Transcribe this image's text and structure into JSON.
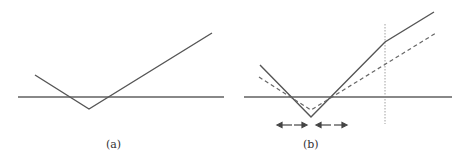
{
  "panels": [
    {
      "id": "a",
      "caption": "(a)"
    },
    {
      "id": "b",
      "caption": "(b)"
    }
  ],
  "colors": {
    "line": "#555555",
    "dashed": "#666666",
    "axis": "#606060"
  }
}
